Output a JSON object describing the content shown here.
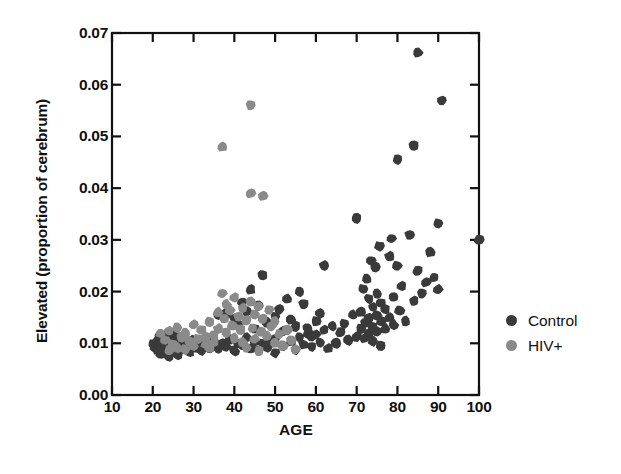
{
  "chart_data": {
    "type": "scatter",
    "title": "",
    "xlabel": "AGE",
    "ylabel": "Elevated (proportion of cerebrum)",
    "xlim": [
      10,
      100
    ],
    "ylim": [
      0.0,
      0.07
    ],
    "xticks": [
      10,
      20,
      30,
      40,
      50,
      60,
      70,
      80,
      90,
      100
    ],
    "xtick_labels": [
      "10",
      "20",
      "30",
      "40",
      "50",
      "60",
      "70",
      "80",
      "90",
      "100"
    ],
    "yticks": [
      0.0,
      0.01,
      0.02,
      0.03,
      0.04,
      0.05,
      0.06,
      0.07
    ],
    "ytick_labels": [
      "0.00",
      "0.01",
      "0.02",
      "0.03",
      "0.04",
      "0.05",
      "0.06",
      "0.07"
    ],
    "grid": false,
    "legend_position": "right",
    "marker_radius_px": 5.2,
    "series": [
      {
        "name": "Control",
        "color": "#3a3a3a",
        "points": [
          [
            20,
            0.0098
          ],
          [
            20.5,
            0.0092
          ],
          [
            21,
            0.0105
          ],
          [
            21,
            0.0088
          ],
          [
            21.5,
            0.0112
          ],
          [
            22,
            0.0095
          ],
          [
            22,
            0.008
          ],
          [
            22.5,
            0.0102
          ],
          [
            23,
            0.009
          ],
          [
            23,
            0.0115
          ],
          [
            23.5,
            0.0084
          ],
          [
            24,
            0.01
          ],
          [
            24,
            0.0075
          ],
          [
            24.5,
            0.0108
          ],
          [
            25,
            0.0094
          ],
          [
            25,
            0.012
          ],
          [
            25.5,
            0.0086
          ],
          [
            26,
            0.01
          ],
          [
            26,
            0.0078
          ],
          [
            26.5,
            0.011
          ],
          [
            27,
            0.0092
          ],
          [
            27.5,
            0.0104
          ],
          [
            28,
            0.0088
          ],
          [
            28.5,
            0.0098
          ],
          [
            29,
            0.0083
          ],
          [
            29.5,
            0.0106
          ],
          [
            30,
            0.0095
          ],
          [
            30.5,
            0.009
          ],
          [
            31,
            0.0102
          ],
          [
            32,
            0.0086
          ],
          [
            33,
            0.0098
          ],
          [
            34,
            0.0091
          ],
          [
            35,
            0.0105
          ],
          [
            36,
            0.0089
          ],
          [
            37,
            0.01
          ],
          [
            38,
            0.0094
          ],
          [
            39,
            0.0108
          ],
          [
            40,
            0.0085
          ],
          [
            41,
            0.01
          ],
          [
            42,
            0.0096
          ],
          [
            43,
            0.0112
          ],
          [
            44,
            0.009
          ],
          [
            45,
            0.0103
          ],
          [
            46,
            0.0087
          ],
          [
            47,
            0.0099
          ],
          [
            48,
            0.0093
          ],
          [
            49,
            0.0107
          ],
          [
            50,
            0.0082
          ],
          [
            36,
            0.0155
          ],
          [
            38,
            0.0158
          ],
          [
            40,
            0.0148
          ],
          [
            41,
            0.0135
          ],
          [
            43,
            0.0161
          ],
          [
            45,
            0.0128
          ],
          [
            46,
            0.0172
          ],
          [
            48,
            0.014
          ],
          [
            50,
            0.0152
          ],
          [
            52,
            0.0124
          ],
          [
            53,
            0.0186
          ],
          [
            55,
            0.0133
          ],
          [
            56,
            0.02
          ],
          [
            58,
            0.0118
          ],
          [
            60,
            0.0143
          ],
          [
            44,
            0.0204
          ],
          [
            42,
            0.018
          ],
          [
            47,
            0.0232
          ],
          [
            51,
            0.0165
          ],
          [
            54,
            0.0146
          ],
          [
            57,
            0.0176
          ],
          [
            59,
            0.0114
          ],
          [
            61,
            0.0158
          ],
          [
            62,
            0.025
          ],
          [
            50,
            0.0108
          ],
          [
            52,
            0.0096
          ],
          [
            54,
            0.0104
          ],
          [
            55,
            0.0088
          ],
          [
            56,
            0.0112
          ],
          [
            57,
            0.0098
          ],
          [
            58,
            0.013
          ],
          [
            59,
            0.0094
          ],
          [
            60,
            0.0117
          ],
          [
            61,
            0.0102
          ],
          [
            62,
            0.0126
          ],
          [
            63,
            0.009
          ],
          [
            64,
            0.0134
          ],
          [
            65,
            0.01
          ],
          [
            66,
            0.0122
          ],
          [
            67,
            0.0138
          ],
          [
            68,
            0.0106
          ],
          [
            69,
            0.0155
          ],
          [
            70,
            0.0113
          ],
          [
            70,
            0.0341
          ],
          [
            71,
            0.016
          ],
          [
            71,
            0.0128
          ],
          [
            71.5,
            0.0205
          ],
          [
            72,
            0.014
          ],
          [
            72,
            0.011
          ],
          [
            72.5,
            0.0225
          ],
          [
            73,
            0.0186
          ],
          [
            73,
            0.0148
          ],
          [
            73,
            0.0118
          ],
          [
            73.5,
            0.026
          ],
          [
            74,
            0.017
          ],
          [
            74,
            0.0132
          ],
          [
            74,
            0.0104
          ],
          [
            74.5,
            0.0248
          ],
          [
            75,
            0.0196
          ],
          [
            75,
            0.0154
          ],
          [
            75,
            0.0122
          ],
          [
            75.5,
            0.0288
          ],
          [
            76,
            0.0178
          ],
          [
            76,
            0.0142
          ],
          [
            76,
            0.0096
          ],
          [
            77,
            0.0165
          ],
          [
            77,
            0.0128
          ],
          [
            78,
            0.0268
          ],
          [
            78,
            0.015
          ],
          [
            78.5,
            0.0302
          ],
          [
            79,
            0.019
          ],
          [
            79,
            0.0136
          ],
          [
            80,
            0.0455
          ],
          [
            80,
            0.025
          ],
          [
            80.5,
            0.0164
          ],
          [
            81,
            0.021
          ],
          [
            82,
            0.0143
          ],
          [
            83,
            0.031
          ],
          [
            84,
            0.0482
          ],
          [
            84,
            0.0182
          ],
          [
            85,
            0.0662
          ],
          [
            85,
            0.024
          ],
          [
            86,
            0.0196
          ],
          [
            87,
            0.0218
          ],
          [
            88,
            0.0276
          ],
          [
            89,
            0.0228
          ],
          [
            90,
            0.0332
          ],
          [
            90,
            0.0204
          ],
          [
            91,
            0.057
          ],
          [
            100,
            0.03
          ]
        ]
      },
      {
        "name": "HIV+",
        "color": "#8a8a8a",
        "points": [
          [
            22,
            0.0118
          ],
          [
            23,
            0.0106
          ],
          [
            24,
            0.0124
          ],
          [
            25,
            0.0098
          ],
          [
            26,
            0.013
          ],
          [
            27,
            0.0112
          ],
          [
            28,
            0.012
          ],
          [
            29,
            0.0104
          ],
          [
            30,
            0.0136
          ],
          [
            31,
            0.0109
          ],
          [
            32,
            0.0126
          ],
          [
            33,
            0.0098
          ],
          [
            34,
            0.0142
          ],
          [
            35,
            0.0115
          ],
          [
            36,
            0.016
          ],
          [
            36,
            0.0128
          ],
          [
            37,
            0.048
          ],
          [
            37,
            0.0196
          ],
          [
            37.5,
            0.0148
          ],
          [
            38,
            0.0175
          ],
          [
            38,
            0.012
          ],
          [
            39,
            0.0164
          ],
          [
            39.5,
            0.0135
          ],
          [
            40,
            0.0188
          ],
          [
            40,
            0.011
          ],
          [
            41,
            0.0152
          ],
          [
            41.5,
            0.0126
          ],
          [
            42,
            0.0168
          ],
          [
            42,
            0.0102
          ],
          [
            43,
            0.0144
          ],
          [
            44,
            0.056
          ],
          [
            44,
            0.039
          ],
          [
            44,
            0.018
          ],
          [
            44.5,
            0.013
          ],
          [
            45,
            0.0156
          ],
          [
            45,
            0.0108
          ],
          [
            46,
            0.0172
          ],
          [
            46.5,
            0.0122
          ],
          [
            47,
            0.0385
          ],
          [
            47,
            0.0148
          ],
          [
            48,
            0.0114
          ],
          [
            48.5,
            0.0165
          ],
          [
            49,
            0.0132
          ],
          [
            50,
            0.01
          ],
          [
            50,
            0.0142
          ],
          [
            51,
            0.0118
          ],
          [
            52,
            0.0095
          ],
          [
            53,
            0.0126
          ],
          [
            54,
            0.0106
          ],
          [
            55,
            0.0088
          ],
          [
            33,
            0.0112
          ],
          [
            34,
            0.0092
          ],
          [
            35,
            0.0102
          ],
          [
            30,
            0.0094
          ],
          [
            28,
            0.0088
          ],
          [
            26,
            0.0092
          ],
          [
            24,
            0.0086
          ],
          [
            43,
            0.0092
          ],
          [
            46,
            0.0085
          ]
        ]
      }
    ]
  },
  "legend": {
    "items": [
      {
        "label": "Control",
        "color": "#3a3a3a"
      },
      {
        "label": "HIV+",
        "color": "#8a8a8a"
      }
    ]
  }
}
